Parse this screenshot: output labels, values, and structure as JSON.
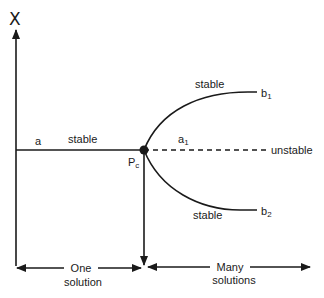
{
  "diagram": {
    "type": "bifurcation-diagram",
    "y_axis_label": "X",
    "branches": {
      "a": {
        "label": "a",
        "stability": "stable"
      },
      "a1": {
        "label": "a",
        "sub": "1",
        "stability": "unstable"
      },
      "b1": {
        "label": "b",
        "sub": "1",
        "stability": "stable"
      },
      "b2": {
        "label": "b",
        "sub": "2",
        "stability": "stable"
      }
    },
    "critical_point": {
      "label": "P",
      "sub": "c"
    },
    "labels": {
      "stable_a": "stable",
      "stable_b1": "stable",
      "stable_b2": "stable",
      "unstable": "unstable"
    },
    "regions": {
      "left_line1": "One",
      "left_line2": "solution",
      "right_line1": "Many",
      "right_line2": "solutions"
    },
    "colors": {
      "line": "#1a1a1a",
      "background": "#ffffff"
    }
  }
}
